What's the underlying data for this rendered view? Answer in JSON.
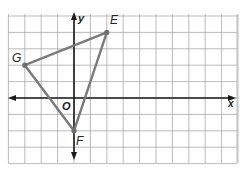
{
  "graph": {
    "grid": {
      "x_min": -4,
      "x_max": 10,
      "y_min": -4,
      "y_max": 5,
      "origin_px": [
        74,
        98
      ],
      "cell_px": 16.4,
      "left_px": 8,
      "right_px": 237,
      "top_px": 14,
      "bottom_px": 163
    },
    "axes": {
      "x_label": "x",
      "y_label": "y",
      "origin_label": "O"
    },
    "points": [
      {
        "name": "E",
        "x": 2,
        "y": 4
      },
      {
        "name": "G",
        "x": -3,
        "y": 2
      },
      {
        "name": "F",
        "x": 0,
        "y": -2
      }
    ],
    "colors": {
      "grid": "#a9a9a9",
      "axis": "#1a1a1a",
      "triangle": "#7a7a7a",
      "point": "#6e6e6e",
      "text": "#222222"
    }
  }
}
